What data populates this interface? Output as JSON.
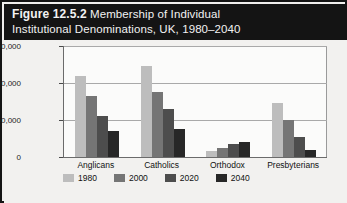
{
  "figure": {
    "label": "Figure 12.5.2",
    "title_line1": "Membership of Individual",
    "title_line2": "Institutional Denominations, UK, 1980–2040"
  },
  "chart_data": {
    "type": "bar",
    "title": "Figure 12.5.2 Membership of Individual Institutional Denominations, UK, 1980–2040",
    "xlabel": "",
    "ylabel": "",
    "ylim": [
      0,
      3000000
    ],
    "grid": true,
    "legend_position": "bottom-left",
    "categories": [
      "Anglicans",
      "Catholics",
      "Orthodox",
      "Presbyterians"
    ],
    "ytick_labels": [
      "0",
      "1,000,000",
      "2,000,000",
      "3,000,000"
    ],
    "ytick_values": [
      0,
      1000000,
      2000000,
      3000000
    ],
    "series": [
      {
        "name": "1980",
        "color": "#bdbdbd",
        "values": [
          2200000,
          2450000,
          150000,
          1450000
        ]
      },
      {
        "name": "2000",
        "color": "#757575",
        "values": [
          1650000,
          1750000,
          250000,
          1000000
        ]
      },
      {
        "name": "2020",
        "color": "#4d4d4d",
        "values": [
          1100000,
          1300000,
          350000,
          550000
        ]
      },
      {
        "name": "2040",
        "color": "#272727",
        "values": [
          700000,
          750000,
          400000,
          180000
        ]
      }
    ]
  }
}
